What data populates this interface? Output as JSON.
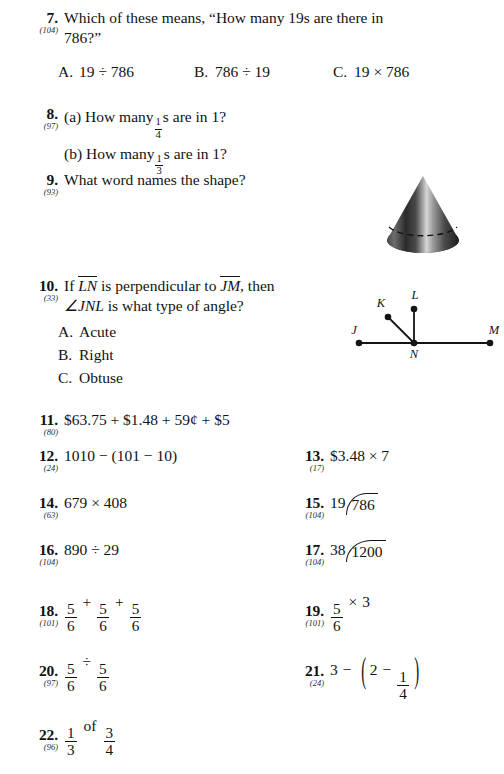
{
  "page": {
    "kind": "math-textbook-practice-set",
    "text_color": "#121212"
  },
  "problems": [
    {
      "number": "7.",
      "ref": "(104)",
      "line1": "Which of these means, “How many 19s are there in",
      "line2": "786?”",
      "options": [
        {
          "label": "A.",
          "text": "19 ÷ 786"
        },
        {
          "label": "B.",
          "text": "786 ÷ 19"
        },
        {
          "label": "C.",
          "text": "19 × 786"
        }
      ]
    },
    {
      "number": "8.",
      "ref": "(97)",
      "part_a_pre": "(a)  How many",
      "part_a_frac": {
        "n": "1",
        "d": "4"
      },
      "part_a_post": "s are in 1?",
      "part_b_pre": "(b)  How many",
      "part_b_frac": {
        "n": "1",
        "d": "3"
      },
      "part_b_post": "s are in 1?"
    },
    {
      "number": "9.",
      "ref": "(93)",
      "text": "What word names the shape?",
      "figure": "cone-3d"
    },
    {
      "number": "10.",
      "ref": "(33)",
      "line1_pre": "If",
      "line1_seg1": "LN",
      "line1_mid": "is perpendicular to",
      "line1_seg2": "JM",
      "line1_post": ", then",
      "line2_angle": "∠JNL",
      "line2_post": "is what type of angle?",
      "options": [
        {
          "label": "A.",
          "text": "Acute"
        },
        {
          "label": "B.",
          "text": "Right"
        },
        {
          "label": "C.",
          "text": "Obtuse"
        }
      ],
      "figure": "angle-jnl",
      "figure_labels": {
        "j": "J",
        "k": "K",
        "l": "L",
        "m": "M",
        "n": "N"
      }
    },
    {
      "number": "11.",
      "ref": "(80)",
      "text": "$63.75  +  $1.48  +  59¢  +  $5"
    },
    {
      "number": "12.",
      "ref": "(24)",
      "text": "1010  −  (101  −  10)"
    },
    {
      "number": "13.",
      "ref": "(17)",
      "text": "$3.48  ×  7"
    },
    {
      "number": "14.",
      "ref": "(63)",
      "text": "679  ×  408"
    },
    {
      "number": "15.",
      "ref": "(104)",
      "divisor": "19",
      "dividend": "786"
    },
    {
      "number": "16.",
      "ref": "(104)",
      "text": "890  ÷  29"
    },
    {
      "number": "17.",
      "ref": "(104)",
      "divisor": "38",
      "dividend": "1200"
    },
    {
      "number": "18.",
      "ref": "(101)",
      "f1": {
        "n": "5",
        "d": "6"
      },
      "op1": "+",
      "f2": {
        "n": "5",
        "d": "6"
      },
      "op2": "+",
      "f3": {
        "n": "5",
        "d": "6"
      }
    },
    {
      "number": "19.",
      "ref": "(101)",
      "f1": {
        "n": "5",
        "d": "6"
      },
      "op1": "×",
      "factor": "3"
    },
    {
      "number": "20.",
      "ref": "(97)",
      "f1": {
        "n": "5",
        "d": "6"
      },
      "op1": "÷",
      "f2": {
        "n": "5",
        "d": "6"
      }
    },
    {
      "number": "21.",
      "ref": "(24)",
      "lead": "3",
      "op1": "−",
      "paren_open": "(",
      "inner_lead": "2",
      "op2": "−",
      "inner_frac": {
        "n": "1",
        "d": "4"
      },
      "paren_close": ")"
    },
    {
      "number": "22.",
      "ref": "(96)",
      "f1": {
        "n": "1",
        "d": "3"
      },
      "word": "of",
      "f2": {
        "n": "3",
        "d": "4"
      }
    }
  ]
}
